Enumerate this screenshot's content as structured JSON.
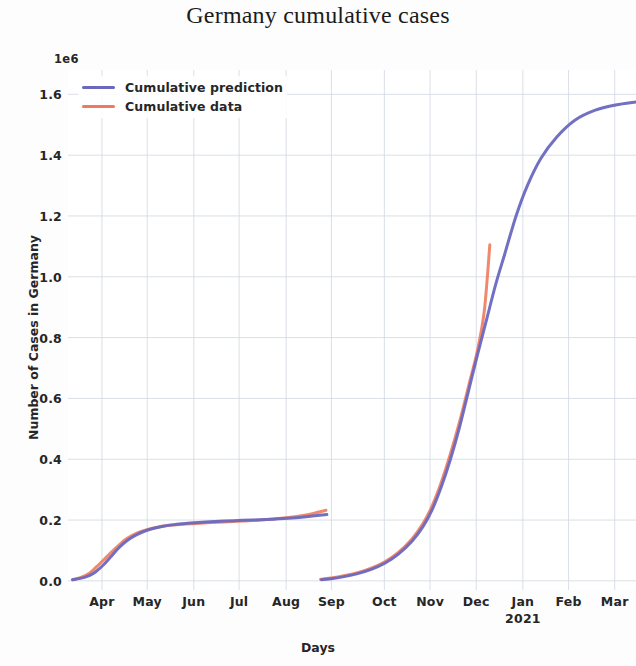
{
  "chart_data": {
    "type": "line",
    "title": "Germany cumulative cases",
    "xlabel": "Days",
    "ylabel": "Number of Cases in Germany",
    "y_offset_text": "1e6",
    "y_tick_labels": [
      "0.0",
      "0.2",
      "0.4",
      "0.6",
      "0.8",
      "1.0",
      "1.2",
      "1.4",
      "1.6"
    ],
    "y_tick_values": [
      0.0,
      0.2,
      0.4,
      0.6,
      0.8,
      1.0,
      1.2,
      1.4,
      1.6
    ],
    "ylim": [
      -0.03,
      1.68
    ],
    "x_tick_labels": [
      "Apr",
      "May",
      "Jun",
      "Jul",
      "Aug",
      "Sep",
      "Oct",
      "Nov",
      "Dec",
      "Jan",
      "Feb",
      "Mar"
    ],
    "x_tick_sublabels": [
      "",
      "",
      "",
      "",
      "",
      "",
      "",
      "",
      "",
      "2021",
      "",
      ""
    ],
    "x_tick_positions": [
      0.75,
      1.75,
      2.78,
      3.78,
      4.82,
      5.82,
      6.99,
      8.0,
      9.02,
      10.05,
      11.06,
      12.08
    ],
    "xlim": [
      0.0,
      12.55
    ],
    "grid": true,
    "legend_position": "upper left",
    "colors": {
      "prediction": "#6a68bf",
      "data": "#ee7b5e",
      "grid": "#d5dbe3",
      "text": "#262626",
      "background": "#ffffff"
    },
    "series": [
      {
        "name": "Cumulative prediction",
        "color": "#6a68bf",
        "segments": [
          {
            "label": "wave-1-prediction",
            "x": [
              0.1,
              0.3,
              0.48,
              0.62,
              0.78,
              0.95,
              1.12,
              1.3,
              1.52,
              1.78,
              2.05,
              2.35,
              2.7,
              3.05,
              3.45,
              3.85,
              4.25,
              4.65,
              5.05,
              5.4,
              5.72
            ],
            "y": [
              0.004,
              0.009,
              0.018,
              0.031,
              0.052,
              0.08,
              0.108,
              0.132,
              0.152,
              0.168,
              0.178,
              0.185,
              0.19,
              0.194,
              0.197,
              0.199,
              0.201,
              0.204,
              0.208,
              0.213,
              0.218
            ]
          },
          {
            "label": "wave-2-prediction",
            "x": [
              5.6,
              5.85,
              6.1,
              6.4,
              6.7,
              7.0,
              7.3,
              7.6,
              7.85,
              8.05,
              8.25,
              8.45,
              8.65,
              8.85,
              9.05,
              9.25,
              9.45,
              9.65,
              9.9,
              10.15,
              10.45,
              10.8,
              11.2,
              11.65,
              12.1,
              12.55
            ],
            "y": [
              0.004,
              0.008,
              0.014,
              0.024,
              0.038,
              0.058,
              0.088,
              0.13,
              0.18,
              0.235,
              0.31,
              0.4,
              0.505,
              0.625,
              0.745,
              0.86,
              0.975,
              1.075,
              1.2,
              1.3,
              1.39,
              1.46,
              1.515,
              1.548,
              1.565,
              1.575
            ]
          }
        ]
      },
      {
        "name": "Cumulative data",
        "color": "#ee7b5e",
        "segments": [
          {
            "label": "wave-1-data",
            "x": [
              0.1,
              0.3,
              0.48,
              0.62,
              0.78,
              0.95,
              1.12,
              1.3,
              1.52,
              1.78,
              2.05,
              2.35,
              2.7,
              3.05,
              3.45,
              3.85,
              4.25,
              4.65,
              5.05,
              5.4,
              5.7
            ],
            "y": [
              0.004,
              0.012,
              0.026,
              0.045,
              0.068,
              0.093,
              0.117,
              0.139,
              0.157,
              0.17,
              0.179,
              0.184,
              0.188,
              0.191,
              0.194,
              0.197,
              0.2,
              0.205,
              0.212,
              0.221,
              0.232
            ]
          },
          {
            "label": "wave-2-data",
            "x": [
              5.58,
              5.85,
              6.1,
              6.4,
              6.7,
              7.0,
              7.3,
              7.6,
              7.85,
              8.05,
              8.25,
              8.45,
              8.65,
              8.85,
              9.05,
              9.2,
              9.32
            ],
            "y": [
              0.005,
              0.01,
              0.017,
              0.027,
              0.042,
              0.063,
              0.094,
              0.138,
              0.19,
              0.248,
              0.325,
              0.418,
              0.522,
              0.64,
              0.76,
              0.89,
              1.105
            ]
          }
        ]
      }
    ]
  },
  "legend": {
    "items": [
      {
        "label": "Cumulative prediction",
        "color": "#6a68bf"
      },
      {
        "label": "Cumulative data",
        "color": "#ee7b5e"
      }
    ]
  }
}
